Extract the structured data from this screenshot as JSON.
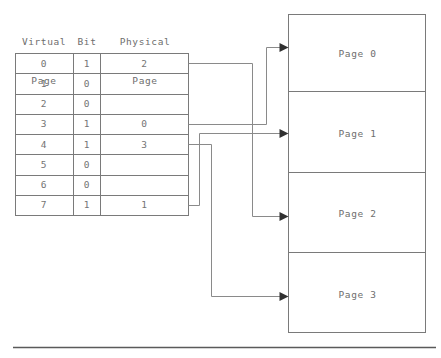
{
  "diagram": {
    "title_omitted": true,
    "headers": {
      "virtual_page": "Virtual\nPage",
      "virtual_page_line1": "Virtual",
      "virtual_page_line2": "Page",
      "bit": "Bit",
      "physical_page_line1": "Physical",
      "physical_page_line2": "Page"
    },
    "page_table": {
      "columns": [
        "Virtual Page",
        "Bit",
        "Physical Page"
      ],
      "rows": [
        {
          "virtual_page": "0",
          "bit": "1",
          "physical_page": "2"
        },
        {
          "virtual_page": "1",
          "bit": "0",
          "physical_page": ""
        },
        {
          "virtual_page": "2",
          "bit": "0",
          "physical_page": ""
        },
        {
          "virtual_page": "3",
          "bit": "1",
          "physical_page": "0"
        },
        {
          "virtual_page": "4",
          "bit": "1",
          "physical_page": "3"
        },
        {
          "virtual_page": "5",
          "bit": "0",
          "physical_page": ""
        },
        {
          "virtual_page": "6",
          "bit": "0",
          "physical_page": ""
        },
        {
          "virtual_page": "7",
          "bit": "1",
          "physical_page": "1"
        }
      ]
    },
    "physical_memory": {
      "frames": [
        {
          "label": "Page 0"
        },
        {
          "label": "Page 1"
        },
        {
          "label": "Page 2"
        },
        {
          "label": "Page 3"
        }
      ]
    },
    "mappings": [
      {
        "from_virtual_page": "0",
        "to_frame": "Page 2"
      },
      {
        "from_virtual_page": "3",
        "to_frame": "Page 0"
      },
      {
        "from_virtual_page": "4",
        "to_frame": "Page 3"
      },
      {
        "from_virtual_page": "7",
        "to_frame": "Page 1"
      }
    ],
    "colors": {
      "line": "#7a7a7a",
      "connector": "#8a8a8a",
      "arrowhead": "#303030",
      "text": "#6e6e6e",
      "rule": "#5a5a5a",
      "background": "#ffffff"
    }
  }
}
